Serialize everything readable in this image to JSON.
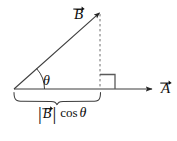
{
  "figure": {
    "kind": "vector-projection-diagram",
    "width": 177,
    "height": 141,
    "background_color": "#ffffff",
    "stroke_color": "#3d3d3d",
    "text_color": "#0d0d0d",
    "dashed_color": "#6e6e6e",
    "labels": {
      "vector_b": "B",
      "vector_a": "A",
      "angle": "θ",
      "projection_magnitude_bar": "|",
      "projection_vector": "B",
      "projection_function": "cos",
      "projection_angle": "θ",
      "projection_full_text": "|B⃗| cos θ"
    },
    "elements": [
      {
        "name": "vector-b-arrow",
        "type": "arrow",
        "from": [
          14,
          89
        ],
        "to": [
          101,
          11
        ]
      },
      {
        "name": "vector-a-arrow",
        "type": "arrow",
        "from": [
          14,
          89
        ],
        "to": [
          159,
          89
        ]
      },
      {
        "name": "projection-dashed-line",
        "type": "dashed-line",
        "from": [
          100,
          14
        ],
        "to": [
          100,
          88
        ]
      },
      {
        "name": "right-angle-mark",
        "type": "square-corner",
        "at": [
          100,
          89
        ],
        "size": 15
      },
      {
        "name": "angle-arc",
        "type": "arc",
        "center": [
          14,
          89
        ],
        "radius": 30,
        "start_deg": 0,
        "end_deg": 42
      },
      {
        "name": "projection-brace",
        "type": "underbrace",
        "from": [
          14,
          93
        ],
        "to": [
          100,
          93
        ]
      }
    ]
  }
}
